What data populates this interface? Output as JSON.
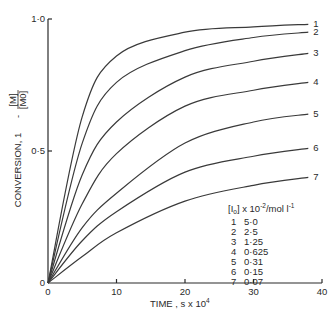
{
  "chart_data": {
    "type": "line",
    "title": "",
    "xlabel": "TIME , s x 10^4",
    "xlabel_main": "TIME , s x 10",
    "xlabel_exp": "4",
    "ylabel": "CONVERSION, 1 - [M]/[M0]",
    "ylabel_main": "CONVERSION, 1",
    "ylabel_num": "[M]",
    "ylabel_den": "[M0]",
    "xlim": [
      0,
      40
    ],
    "ylim": [
      0,
      1.0
    ],
    "x_ticks": [
      0,
      10,
      20,
      30,
      40
    ],
    "x_tick_labels": [
      "0",
      "10",
      "20",
      "30",
      "40"
    ],
    "y_ticks": [
      0,
      0.5,
      1.0
    ],
    "y_tick_labels": [
      "0",
      "0·5",
      "1·0"
    ],
    "grid": false,
    "legend_title": "[I0] x 10^-2 / mol l^-1",
    "legend_position": "lower right",
    "x": [
      0,
      5,
      10,
      20,
      30,
      38
    ],
    "series": [
      {
        "name": "1",
        "I0": "5·0",
        "values": [
          0,
          0.63,
          0.86,
          0.95,
          0.97,
          0.98
        ]
      },
      {
        "name": "2",
        "I0": "2·5",
        "values": [
          0,
          0.53,
          0.76,
          0.88,
          0.93,
          0.95
        ]
      },
      {
        "name": "3",
        "I0": "1·25",
        "values": [
          0,
          0.41,
          0.61,
          0.78,
          0.84,
          0.87
        ]
      },
      {
        "name": "4",
        "I0": "0·625",
        "values": [
          0,
          0.3,
          0.49,
          0.67,
          0.73,
          0.76
        ]
      },
      {
        "name": "5",
        "I0": "0·31",
        "values": [
          0,
          0.21,
          0.34,
          0.53,
          0.61,
          0.64
        ]
      },
      {
        "name": "6",
        "I0": "0·15",
        "values": [
          0,
          0.16,
          0.27,
          0.42,
          0.48,
          0.51
        ]
      },
      {
        "name": "7",
        "I0": "0·07",
        "values": [
          0,
          0.1,
          0.19,
          0.31,
          0.37,
          0.4
        ]
      }
    ]
  },
  "legend": {
    "title_main": "[I",
    "title_sub": "o",
    "title_rest": "] x 10",
    "title_exp": "-2",
    "title_unit": "/mol l",
    "title_unit_exp": "-1"
  },
  "colors": {
    "line": "#3a3a3a",
    "axis": "#2a2a2a",
    "background": "#ffffff"
  }
}
